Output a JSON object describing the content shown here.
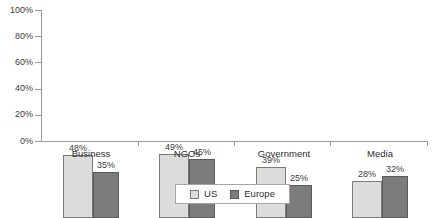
{
  "chart_data": {
    "type": "bar",
    "title": "",
    "xlabel": "",
    "ylabel": "",
    "ylim": [
      0,
      100
    ],
    "ytick_labels": [
      "100%",
      "80%",
      "60%",
      "40%",
      "20%",
      "0%"
    ],
    "ytick_values": [
      100,
      80,
      60,
      40,
      20,
      0
    ],
    "grid": false,
    "legend_position": "bottom-center",
    "categories": [
      "Business",
      "NGOs",
      "Government",
      "Media"
    ],
    "series": [
      {
        "name": "US",
        "color": "#dcdcdc",
        "values": [
          48,
          49,
          39,
          28
        ],
        "data_labels": [
          "48%",
          "49%",
          "39%",
          "28%"
        ]
      },
      {
        "name": "Europe",
        "color": "#7c7c7c",
        "values": [
          35,
          45,
          25,
          32
        ],
        "data_labels": [
          "35%",
          "45%",
          "25%",
          "32%"
        ]
      }
    ]
  },
  "legend": {
    "items": [
      {
        "label": "US",
        "swatch": "us"
      },
      {
        "label": "Europe",
        "swatch": "eu"
      }
    ]
  }
}
